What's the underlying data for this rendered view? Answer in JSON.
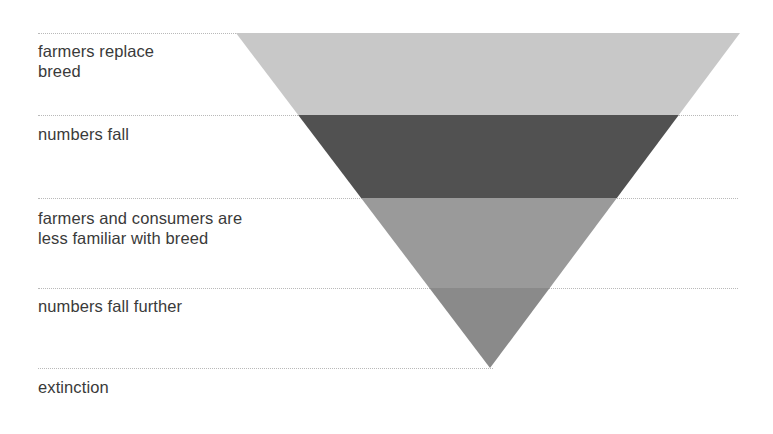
{
  "diagram": {
    "type": "inverted-funnel",
    "background_color": "#ffffff",
    "text_color": "#3a3a3a",
    "separator_color": "#b9b9b9",
    "geometry": {
      "top_left_x": 236,
      "top_right_x": 740,
      "top_y": 33,
      "apex_x": 490,
      "apex_y": 368
    },
    "stages": [
      {
        "label": "farmers replace\nbreed",
        "band_color": "#c8c8c8",
        "band_top": 33,
        "band_bottom": 115,
        "label_x": 38,
        "label_y": 41
      },
      {
        "label": "numbers fall",
        "band_color": "#515151",
        "band_top": 115,
        "band_bottom": 198,
        "label_x": 38,
        "label_y": 124
      },
      {
        "label": "farmers and consumers are\nless familiar with breed",
        "band_color": "#9a9a9a",
        "band_top": 198,
        "band_bottom": 288,
        "label_x": 38,
        "label_y": 208
      },
      {
        "label": "numbers fall further",
        "band_color": "#8a8a8a",
        "band_top": 288,
        "band_bottom": 368,
        "label_x": 38,
        "label_y": 296
      },
      {
        "label": "extinction",
        "band_color": null,
        "band_top": 368,
        "band_bottom": 368,
        "label_x": 38,
        "label_y": 377
      }
    ],
    "separators": [
      {
        "y": 33,
        "x": 38,
        "width": 700
      },
      {
        "y": 115,
        "x": 38,
        "width": 700
      },
      {
        "y": 198,
        "x": 38,
        "width": 700
      },
      {
        "y": 288,
        "x": 38,
        "width": 700
      },
      {
        "y": 368,
        "x": 38,
        "width": 455
      }
    ]
  }
}
